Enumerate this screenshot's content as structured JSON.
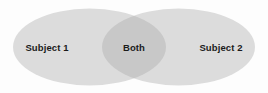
{
  "diagram": {
    "type": "venn",
    "set_count": 2,
    "background_color": "#fdfdfd",
    "circle_fill": "#dcdcdc",
    "overlap_fill": "#c8c8c8",
    "text_color": "#1b1b1b",
    "regions": [
      {
        "id": "left",
        "label": "Subject 1",
        "kind": "set-only"
      },
      {
        "id": "both",
        "label": "Both",
        "kind": "intersection"
      },
      {
        "id": "right",
        "label": "Subject 2",
        "kind": "set-only"
      }
    ]
  }
}
